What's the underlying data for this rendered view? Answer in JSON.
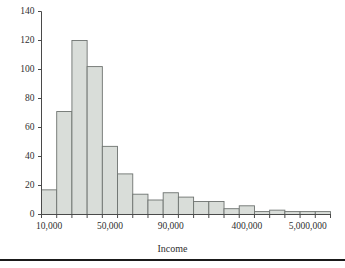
{
  "figure": {
    "background_color": "#ffffff",
    "bottom_rule_color": "#1a1a1a",
    "axis_color": "#4a4a4a",
    "bar_fill_color": "#d9ddd9",
    "bar_border_color": "#6e7370"
  },
  "chart_data": {
    "type": "bar",
    "title": "",
    "subtitle": "",
    "xlabel": "Income",
    "ylabel": "",
    "grid": false,
    "legend": false,
    "legend_position": "none",
    "ylim": [
      0,
      140
    ],
    "ytick_labels": [
      "0",
      "20",
      "40",
      "60",
      "80",
      "100",
      "120",
      "140"
    ],
    "ytick_values": [
      0,
      20,
      40,
      60,
      80,
      100,
      120,
      140
    ],
    "xtick_labels": [
      "10,000",
      "50,000",
      "90,000",
      "400,000",
      "5,000,000"
    ],
    "xtick_label_bin_index": [
      0,
      4,
      8,
      13,
      17
    ],
    "bin_count": 19,
    "categories": [
      "bin-1",
      "bin-2",
      "bin-3",
      "bin-4",
      "bin-5",
      "bin-6",
      "bin-7",
      "bin-8",
      "bin-9",
      "bin-10",
      "bin-11",
      "bin-12",
      "bin-13",
      "bin-14",
      "bin-15",
      "bin-16",
      "bin-17",
      "bin-18",
      "bin-19"
    ],
    "values": [
      17,
      71,
      120,
      102,
      47,
      28,
      14,
      10,
      15,
      12,
      9,
      9,
      4,
      6,
      2,
      3,
      2,
      2,
      2
    ]
  }
}
